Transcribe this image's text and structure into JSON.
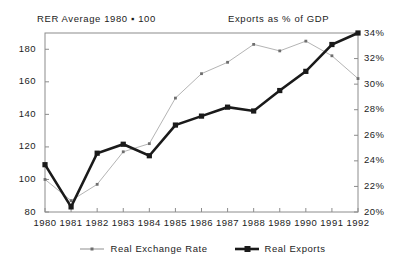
{
  "chart_data": {
    "type": "line",
    "title": "",
    "left_axis_title": "RER Average 1980 ▪ 100",
    "right_axis_title": "Exports as % of GDP",
    "xlabel": "",
    "ylabel": "",
    "grid": false,
    "legend_position": "bottom-center",
    "categories": [
      "1980",
      "1981",
      "1982",
      "1983",
      "1984",
      "1985",
      "1986",
      "1987",
      "1988",
      "1989",
      "1990",
      "1991",
      "1992"
    ],
    "x": [
      1980,
      1981,
      1982,
      1983,
      1984,
      1985,
      1986,
      1987,
      1988,
      1989,
      1990,
      1991,
      1992
    ],
    "left_axis": {
      "name": "RER Average 1980 = 100",
      "ylim": [
        80,
        190
      ],
      "ticks": [
        80,
        100,
        120,
        140,
        160,
        180
      ],
      "tick_labels": [
        "80",
        "100",
        "120",
        "140",
        "160",
        "180"
      ]
    },
    "right_axis": {
      "name": "Exports as % of GDP",
      "ylim": [
        20,
        34
      ],
      "ticks": [
        20,
        22,
        24,
        26,
        28,
        30,
        32,
        34
      ],
      "tick_labels": [
        "20%",
        "22%",
        "24%",
        "26%",
        "28%",
        "30%",
        "32%",
        "34%"
      ]
    },
    "series": [
      {
        "name": "Real Exchange Rate",
        "axis": "left",
        "color": "#b4b4b4",
        "marker": "small-square",
        "line_width": 1,
        "values": [
          100,
          87,
          97,
          117,
          122,
          150,
          165,
          172,
          183,
          179,
          185,
          176,
          162
        ]
      },
      {
        "name": "Real Exports",
        "axis": "right",
        "color": "#1a1a1a",
        "marker": "square",
        "line_width": 2.6,
        "values": [
          23.7,
          20.4,
          24.6,
          25.3,
          24.4,
          26.8,
          27.5,
          28.2,
          27.9,
          29.5,
          31.0,
          33.1,
          34.0
        ]
      }
    ]
  },
  "legend": {
    "items": [
      {
        "label": "Real Exchange Rate",
        "color": "#9a9a9a",
        "style": "thin"
      },
      {
        "label": "Real Exports",
        "color": "#1a1a1a",
        "style": "thick"
      }
    ]
  },
  "axes_ticks": {
    "left": [
      "180",
      "160",
      "140",
      "120",
      "100",
      "80"
    ],
    "right": [
      "34%",
      "32%",
      "30%",
      "28%",
      "26%",
      "24%",
      "22%",
      "20%"
    ],
    "bottom": [
      "1980",
      "1981",
      "1982",
      "1983",
      "1984",
      "1985",
      "1986",
      "1987",
      "1988",
      "1989",
      "1990",
      "1991",
      "1992"
    ]
  },
  "frame_color": "#8c8c8c"
}
